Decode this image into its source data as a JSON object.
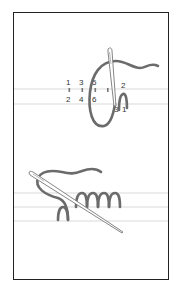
{
  "diagram": {
    "panels": [
      {
        "name": "step-1",
        "stitch_labels_top": [
          "1",
          "3",
          "5"
        ],
        "stitch_labels_bottom": [
          "2",
          "4",
          "6"
        ],
        "needle_labels": [
          "2",
          "3",
          "1"
        ]
      },
      {
        "name": "step-2",
        "description": "completed stitch loops with needle"
      }
    ],
    "colors": {
      "thread": "#6b6b6b",
      "guide_line": "#c8c8c8",
      "border": "#222222",
      "needle": "#888888"
    }
  }
}
